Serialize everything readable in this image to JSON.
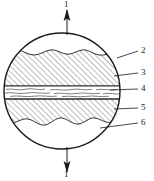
{
  "figure": {
    "type": "cross-section-schematic",
    "shape": "circle",
    "background_color": "#ffffff",
    "line_color": "#1a1a1a",
    "hatch_color": "#555555"
  },
  "load_arrows": [
    {
      "id": "top",
      "label": "1",
      "direction": "up",
      "label_x": 70,
      "label_y": 1
    },
    {
      "id": "bottom",
      "label": "1",
      "direction": "down",
      "label_x": 70,
      "label_y": 169
    }
  ],
  "callouts": [
    {
      "label": "2",
      "label_x": 141,
      "label_y": 47,
      "leader_from_x": 117,
      "leader_from_y": 58,
      "leader_to_x": 138,
      "leader_to_y": 51,
      "target": "outer-circle-boundary"
    },
    {
      "label": "3",
      "label_x": 141,
      "label_y": 70,
      "leader_from_x": 114,
      "leader_from_y": 76,
      "leader_to_x": 138,
      "leader_to_y": 74,
      "target": "upper-hatched-zone"
    },
    {
      "label": "4",
      "label_x": 141,
      "label_y": 86,
      "leader_from_x": 110,
      "leader_from_y": 90,
      "leader_to_x": 138,
      "leader_to_y": 90,
      "target": "middle-wavy-band"
    },
    {
      "label": "5",
      "label_x": 141,
      "label_y": 105,
      "leader_from_x": 114,
      "leader_from_y": 109,
      "leader_to_x": 138,
      "leader_to_y": 109,
      "target": "lower-hatched-zone"
    },
    {
      "label": "6",
      "label_x": 141,
      "label_y": 120,
      "leader_from_x": 100,
      "leader_from_y": 128,
      "leader_to_x": 138,
      "leader_to_y": 124,
      "target": "lower-clear-zone"
    }
  ],
  "zones": [
    {
      "id": 2,
      "name": "outer boundary / clear upper region",
      "fill": "none"
    },
    {
      "id": 3,
      "name": "upper hatched layer",
      "fill": "diagonal-hatch"
    },
    {
      "id": 4,
      "name": "middle wavy interlayer",
      "fill": "wavy-lines"
    },
    {
      "id": 5,
      "name": "lower hatched layer",
      "fill": "diagonal-hatch"
    },
    {
      "id": 6,
      "name": "lower clear region",
      "fill": "none"
    }
  ]
}
